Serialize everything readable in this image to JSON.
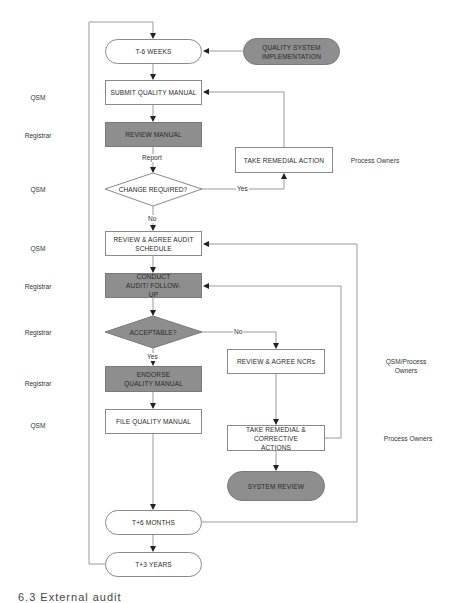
{
  "diagram": {
    "nodes": {
      "t_minus_6_weeks": "T-6 WEEKS",
      "quality_system_implementation": "QUALITY SYSTEM IMPLEMENTATION",
      "submit_quality_manual": "SUBMIT QUALITY MANUAL",
      "review_manual": "REVIEW MANUAL",
      "change_required": "CHANGE REQUIRED?",
      "take_remedial_action": "TAKE REMEDIAL ACTION",
      "review_agree_audit_schedule": "REVIEW & AGREE AUDIT SCHEDULE",
      "conduct_audit_follow_up": "CONDUCT AUDIT/ FOLLOW-UP",
      "acceptable": "ACCEPTABLE?",
      "review_agree_ncrs": "REVIEW & AGREE NCRs",
      "endorse_quality_manual": "ENDORSE QUALITY MANUAL",
      "file_quality_manual": "FILE QUALITY MANUAL",
      "take_remedial_corrective_actions": "TAKE REMEDIAL & CORRECTIVE ACTIONS",
      "system_review": "SYSTEM REVIEW",
      "t_plus_6_months": "T+6 MONTHS",
      "t_plus_3_years": "T+3 YEARS"
    },
    "edge_labels": {
      "report": "Report",
      "yes_change": "Yes",
      "no_change": "No",
      "no_acceptable": "No",
      "yes_acceptable": "Yes"
    },
    "roles_left": [
      "QSM",
      "Registrar",
      "QSM",
      "QSM",
      "Registrar",
      "Registrar",
      "Registrar",
      "QSM"
    ],
    "roles_right": {
      "remedial_action": "Process Owners",
      "ncrs": "QSM/Process Owners",
      "corrective_actions": "Process Owners"
    },
    "caption": "6.3  External audit"
  }
}
